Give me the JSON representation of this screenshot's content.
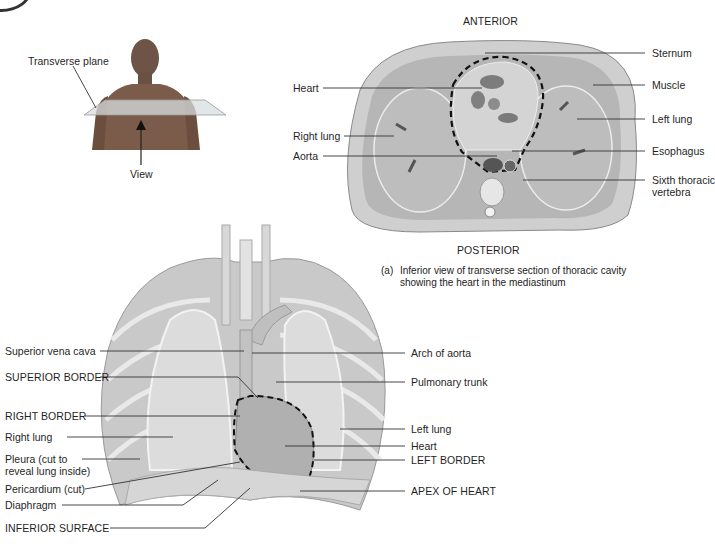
{
  "figure_a": {
    "orientation_top": "ANTERIOR",
    "orientation_bottom": "POSTERIOR",
    "caption_marker": "(a)",
    "caption_line1": "Inferior view of transverse section of thoracic cavity",
    "caption_line2": "showing the heart in the mediastinum",
    "labels_left": [
      "Heart",
      "Right lung",
      "Aorta"
    ],
    "labels_right": [
      "Sternum",
      "Muscle",
      "Left lung",
      "Esophagus",
      "Sixth thoracic",
      "vertebra"
    ]
  },
  "inset": {
    "plane_label": "Transverse plane",
    "view_label": "View"
  },
  "figure_b": {
    "labels_left": [
      "Superior vena cava",
      "SUPERIOR BORDER",
      "RIGHT BORDER",
      "Right lung",
      "Pleura (cut to",
      "reveal lung inside)",
      "Pericardium (cut)",
      "Diaphragm",
      "INFERIOR SURFACE"
    ],
    "labels_right": [
      "Arch of aorta",
      "Pulmonary trunk",
      "Left lung",
      "Heart",
      "LEFT BORDER",
      "APEX OF HEART"
    ]
  },
  "colors": {
    "tissue_light": "#d9d9d9",
    "tissue_mid": "#a8a8a8",
    "tissue_dark": "#6e6e6e",
    "leader_line": "#333333",
    "dashed_outline": "#111111",
    "skin": "#7a5a48"
  }
}
